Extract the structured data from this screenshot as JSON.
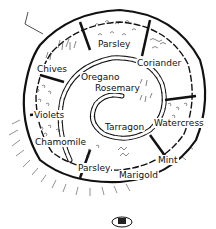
{
  "diagram": {
    "type": "herb-spiral garden illustration",
    "style": "black-and-white hand-drawn line art",
    "colors": {
      "ink": "#111111",
      "background": "#ffffff",
      "stone_fill": "#ffffff"
    },
    "labels": {
      "parsley_top": "Parsley",
      "coriander": "Coriander",
      "chives": "Chives",
      "oregano": "Oregano",
      "rosemary": "Rosemary",
      "violets": "Violets",
      "tarragon": "Tarragon",
      "watercress": "Watercress",
      "chamomile": "Chamomile",
      "mint": "Mint",
      "parsley_bottom": "Parsley",
      "marigold": "Marigold"
    }
  }
}
